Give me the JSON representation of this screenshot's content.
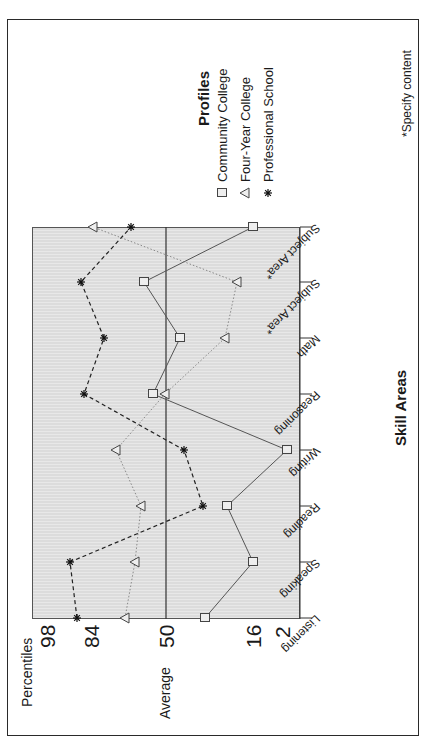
{
  "chart_data": {
    "type": "line",
    "orientation": "rotated-90-ccw",
    "title": "",
    "ylabel": "Percentiles",
    "xlabel": "Skill Areas",
    "average_label": "Average",
    "y_ticks": [
      98,
      84,
      50,
      16,
      2
    ],
    "ylim": [
      2,
      98
    ],
    "average_line": 50,
    "categories": [
      "Listening",
      "Speaking",
      "Reading",
      "Writing",
      "Reasoning",
      "Math",
      "Subject Area*",
      "Subject Area*"
    ],
    "series": [
      {
        "name": "Community College",
        "marker": "square",
        "line": "solid",
        "values": [
          34,
          16,
          24,
          2,
          56,
          44,
          60,
          16
        ]
      },
      {
        "name": "Four-Year College",
        "marker": "triangle",
        "line": "dotted",
        "values": [
          70,
          66,
          63,
          74,
          50,
          25,
          21,
          83
        ]
      },
      {
        "name": "Professional School",
        "marker": "star",
        "line": "dashed",
        "values": [
          88,
          91,
          35,
          42,
          86,
          78,
          87,
          67
        ]
      }
    ],
    "legend": {
      "title": "Profiles",
      "position": "right"
    },
    "footnote": "*Specify content",
    "grid": false
  },
  "labels": {
    "percentiles": "Percentiles",
    "average": "Average",
    "skill_areas": "Skill Areas",
    "profiles": "Profiles",
    "footnote": "*Specify content",
    "ticks": [
      "98",
      "84",
      "50",
      "16",
      "2"
    ],
    "categories": [
      "Listening",
      "Speaking",
      "Reading",
      "Writing",
      "Reasoning",
      "Math",
      "Subject Area*",
      "Subject Area*"
    ],
    "legend": [
      "Community College",
      "Four-Year College",
      "Professional School"
    ]
  },
  "layout": {
    "tick_x": {
      "98": 47,
      "84": 91,
      "50": 166,
      "16": 253,
      "2": 282
    },
    "category_y": [
      618,
      562,
      506,
      450,
      394,
      338,
      282,
      227
    ],
    "points_x": {
      "Community College": [
        205,
        253,
        227,
        287,
        153,
        180,
        144,
        253
      ],
      "Four-Year College": [
        125,
        135,
        141,
        116,
        165,
        225,
        237,
        93
      ],
      "Professional School": [
        77,
        70,
        203,
        184,
        84,
        104,
        81,
        131
      ]
    }
  }
}
